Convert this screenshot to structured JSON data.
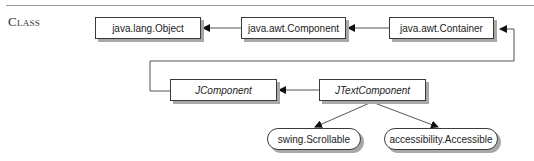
{
  "section": {
    "label": "Class"
  },
  "diagram": {
    "classes": [
      {
        "id": "object",
        "label": "java.lang.Object",
        "style": "class"
      },
      {
        "id": "component",
        "label": "java.awt.Component",
        "style": "class"
      },
      {
        "id": "container",
        "label": "java.awt.Container",
        "style": "class"
      },
      {
        "id": "jcomponent",
        "label": "JComponent",
        "style": "abstract"
      },
      {
        "id": "jtextcomponent",
        "label": "JTextComponent",
        "style": "abstract"
      },
      {
        "id": "scrollable",
        "label": "swing.Scrollable",
        "style": "interface"
      },
      {
        "id": "accessible",
        "label": "accessibility.Accessible",
        "style": "interface"
      }
    ],
    "relations": [
      {
        "from": "component",
        "to": "object",
        "type": "extends"
      },
      {
        "from": "container",
        "to": "component",
        "type": "extends"
      },
      {
        "from": "jcomponent",
        "to": "container",
        "type": "extends"
      },
      {
        "from": "jtextcomponent",
        "to": "jcomponent",
        "type": "extends"
      },
      {
        "from": "jtextcomponent",
        "to": "scrollable",
        "type": "implements"
      },
      {
        "from": "jtextcomponent",
        "to": "accessible",
        "type": "implements"
      }
    ]
  }
}
